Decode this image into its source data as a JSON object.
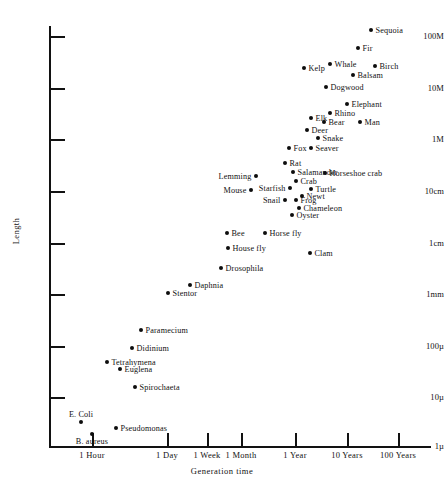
{
  "chart_data": {
    "type": "scatter",
    "title": "",
    "xlabel": "Generation time",
    "ylabel": "Length",
    "grid": false,
    "legend": null,
    "xscale": "log",
    "yscale": "log",
    "xticks": [
      {
        "label": "1 Hour",
        "px": 92
      },
      {
        "label": "1 Day",
        "px": 167
      },
      {
        "label": "1 Week",
        "px": 207
      },
      {
        "label": "1 Month",
        "px": 241
      },
      {
        "label": "1 Year",
        "px": 295
      },
      {
        "label": "10 Years",
        "px": 347
      },
      {
        "label": "100 Years",
        "px": 398
      }
    ],
    "yticks": [
      {
        "label": "100M",
        "px": 36
      },
      {
        "label": "10M",
        "px": 88
      },
      {
        "label": "1M",
        "px": 139
      },
      {
        "label": "10cm",
        "px": 191
      },
      {
        "label": "1cm",
        "px": 243
      },
      {
        "label": "1mm",
        "px": 294
      },
      {
        "label": "100µ",
        "px": 346
      },
      {
        "label": "10µ",
        "px": 397
      },
      {
        "label": "1µ",
        "px": 446
      }
    ],
    "points": [
      {
        "name": "Sequoia",
        "x": 371,
        "y": 30,
        "pos": "right"
      },
      {
        "name": "Fir",
        "x": 358,
        "y": 48,
        "pos": "right"
      },
      {
        "name": "Kelp",
        "x": 304,
        "y": 68,
        "pos": "right"
      },
      {
        "name": "Whale",
        "x": 330,
        "y": 64,
        "pos": "right"
      },
      {
        "name": "Birch",
        "x": 375,
        "y": 66,
        "pos": "right"
      },
      {
        "name": "Balsam",
        "x": 353,
        "y": 75,
        "pos": "right"
      },
      {
        "name": "Dogwood",
        "x": 326,
        "y": 87,
        "pos": "right"
      },
      {
        "name": "Elephant",
        "x": 347,
        "y": 104,
        "pos": "right"
      },
      {
        "name": "Rhino",
        "x": 330,
        "y": 113,
        "pos": "right"
      },
      {
        "name": "Elk",
        "x": 311,
        "y": 118,
        "pos": "right"
      },
      {
        "name": "Bear",
        "x": 324,
        "y": 122,
        "pos": "right"
      },
      {
        "name": "Man",
        "x": 360,
        "y": 122,
        "pos": "right"
      },
      {
        "name": "Deer",
        "x": 307,
        "y": 130,
        "pos": "right"
      },
      {
        "name": "Snake",
        "x": 318,
        "y": 138,
        "pos": "right"
      },
      {
        "name": "Fox",
        "x": 289,
        "y": 148,
        "pos": "right"
      },
      {
        "name": "Seaver",
        "x": 311,
        "y": 148,
        "pos": "right"
      },
      {
        "name": "Rat",
        "x": 285,
        "y": 163,
        "pos": "right"
      },
      {
        "name": "Salamander",
        "x": 293,
        "y": 172,
        "pos": "right"
      },
      {
        "name": "Horseshoe crab",
        "x": 325,
        "y": 173,
        "pos": "right"
      },
      {
        "name": "Lemming",
        "x": 256,
        "y": 176,
        "pos": "left"
      },
      {
        "name": "Crab",
        "x": 296,
        "y": 181,
        "pos": "right"
      },
      {
        "name": "Mouse",
        "x": 251,
        "y": 190,
        "pos": "left"
      },
      {
        "name": "Starfish",
        "x": 290,
        "y": 188,
        "pos": "left"
      },
      {
        "name": "Turtle",
        "x": 311,
        "y": 189,
        "pos": "right"
      },
      {
        "name": "Newt",
        "x": 302,
        "y": 196,
        "pos": "right"
      },
      {
        "name": "Snail",
        "x": 285,
        "y": 200,
        "pos": "left"
      },
      {
        "name": "Frog",
        "x": 296,
        "y": 200,
        "pos": "right"
      },
      {
        "name": "Chameleon",
        "x": 299,
        "y": 208,
        "pos": "right"
      },
      {
        "name": "Oyster",
        "x": 292,
        "y": 215,
        "pos": "right"
      },
      {
        "name": "Bee",
        "x": 227,
        "y": 233,
        "pos": "right"
      },
      {
        "name": "Horse fly",
        "x": 265,
        "y": 233,
        "pos": "right"
      },
      {
        "name": "House fly",
        "x": 228,
        "y": 248,
        "pos": "right"
      },
      {
        "name": "Clam",
        "x": 310,
        "y": 253,
        "pos": "right"
      },
      {
        "name": "Drosophila",
        "x": 221,
        "y": 268,
        "pos": "right"
      },
      {
        "name": "Daphnia",
        "x": 190,
        "y": 285,
        "pos": "right"
      },
      {
        "name": "Stentor",
        "x": 168,
        "y": 293,
        "pos": "right"
      },
      {
        "name": "Paramecium",
        "x": 141,
        "y": 330,
        "pos": "right"
      },
      {
        "name": "Didinium",
        "x": 132,
        "y": 348,
        "pos": "right"
      },
      {
        "name": "Tetrahymena",
        "x": 107,
        "y": 362,
        "pos": "right"
      },
      {
        "name": "Euglena",
        "x": 120,
        "y": 369,
        "pos": "right"
      },
      {
        "name": "Spirochaeta",
        "x": 135,
        "y": 387,
        "pos": "right"
      },
      {
        "name": "E. Coli",
        "x": 81,
        "y": 422,
        "pos": "above"
      },
      {
        "name": "Pseudomonas",
        "x": 116,
        "y": 428,
        "pos": "right"
      },
      {
        "name": "B. aureus",
        "x": 92,
        "y": 434,
        "pos": "below"
      }
    ]
  }
}
